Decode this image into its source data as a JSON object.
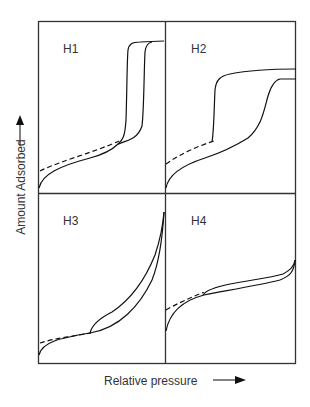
{
  "figure": {
    "x_axis_label": "Relative pressure",
    "y_axis_label": "Amount Adsorbed",
    "panels": [
      {
        "id": "H1",
        "label": "H1",
        "position": "top-left"
      },
      {
        "id": "H2",
        "label": "H2",
        "position": "top-right"
      },
      {
        "id": "H3",
        "label": "H3",
        "position": "bottom-left"
      },
      {
        "id": "H4",
        "label": "H4",
        "position": "bottom-right"
      }
    ],
    "legend_hint": {
      "solid": "adsorption/desorption branches",
      "dashed": "low-pressure hysteresis extension"
    },
    "colors": {
      "line": "#111111",
      "frame": "#333333",
      "background": "#ffffff"
    }
  }
}
